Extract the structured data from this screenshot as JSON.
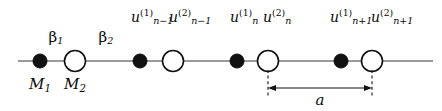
{
  "figure": {
    "type": "diatomic-linear-chain-lattice",
    "width": 442,
    "height": 111,
    "background_color": "#ffffff",
    "line_color": "#7a7a7a",
    "ink_color": "#0a0a0a",
    "chain": {
      "axis_y": 61,
      "x_start": 18,
      "x_end": 433,
      "atoms": [
        {
          "id": "a1-m1",
          "kind": "filled",
          "cx": 40,
          "r": 7.0
        },
        {
          "id": "a1-m2",
          "kind": "open",
          "cx": 75,
          "r": 10.5
        },
        {
          "id": "a2-m1",
          "kind": "filled",
          "cx": 140,
          "r": 7.0
        },
        {
          "id": "a2-m2",
          "kind": "open",
          "cx": 173,
          "r": 10.5
        },
        {
          "id": "a3-m1",
          "kind": "filled",
          "cx": 237,
          "r": 7.0
        },
        {
          "id": "a3-m2",
          "kind": "open",
          "cx": 268,
          "r": 10.5
        },
        {
          "id": "a4-m1",
          "kind": "filled",
          "cx": 341,
          "r": 7.0
        },
        {
          "id": "a4-m2",
          "kind": "open",
          "cx": 372,
          "r": 10.5
        }
      ]
    },
    "dimension": {
      "name": "lattice-constant",
      "label": "a",
      "from_x": 268,
      "to_x": 372,
      "arrow_y": 88,
      "ext_top_y": 70,
      "ext_bottom_y": 95,
      "label_x": 320,
      "label_y": 93
    }
  },
  "labels": {
    "spring_constants": [
      {
        "name": "beta-1",
        "base": "β",
        "sub": "1",
        "x": 56,
        "y": 30
      },
      {
        "name": "beta-2",
        "base": "β",
        "sub": "2",
        "x": 106,
        "y": 30
      }
    ],
    "masses": [
      {
        "name": "mass-1",
        "base": "M",
        "sub": "1",
        "x": 40,
        "y": 77
      },
      {
        "name": "mass-2",
        "base": "M",
        "sub": "2",
        "x": 75,
        "y": 77
      }
    ],
    "displacements": [
      {
        "name": "u-n-minus-1-1",
        "base": "u",
        "sup": "(1)",
        "sub": "n−1",
        "x": 131,
        "align": "left"
      },
      {
        "name": "u-n-minus-1-2",
        "base": "u",
        "sup": "(2)",
        "sub": "n−1",
        "x": 169,
        "align": "left"
      },
      {
        "name": "u-n-1",
        "base": "u",
        "sup": "(1)",
        "sub": "n",
        "x": 230,
        "align": "left"
      },
      {
        "name": "u-n-2",
        "base": "u",
        "sup": "(2)",
        "sub": "n",
        "x": 263,
        "align": "left"
      },
      {
        "name": "u-n-plus-1-1",
        "base": "u",
        "sup": "(1)",
        "sub": "n+1",
        "x": 330,
        "align": "left"
      },
      {
        "name": "u-n-plus-1-2",
        "base": "u",
        "sup": "(2)",
        "sub": "n+1",
        "x": 371,
        "align": "left"
      }
    ]
  }
}
